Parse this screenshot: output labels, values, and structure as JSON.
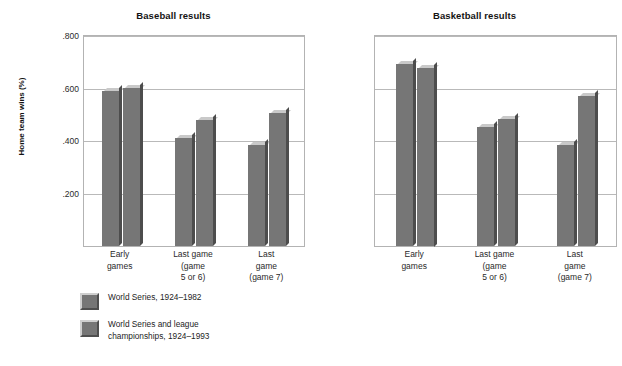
{
  "figure": {
    "ylabel": "Home team wins (%)"
  },
  "chart_data": [
    {
      "type": "bar",
      "title": "Baseball results",
      "xlabel": "",
      "ylabel": "Home team wins (%)",
      "ylim": [
        0,
        0.8
      ],
      "yticks": [
        ".200",
        ".400",
        ".600",
        ".800"
      ],
      "ytick_values": [
        0.2,
        0.4,
        0.6,
        0.8
      ],
      "grid": true,
      "legend_position": "below",
      "categories": [
        "Early games",
        "Last game (game 5 or 6)",
        "Last game (game 7)"
      ],
      "category_lines": [
        [
          "Early",
          "games"
        ],
        [
          "Last game",
          "(game",
          "5 or 6)"
        ],
        [
          "Last",
          "game",
          "(game 7)"
        ]
      ],
      "series": [
        {
          "name": "World Series, 1924–1982",
          "values": [
            0.59,
            0.41,
            0.383
          ]
        },
        {
          "name": "World Series and league championships, 1924–1993",
          "values": [
            0.602,
            0.48,
            0.505
          ]
        }
      ],
      "legend": [
        {
          "label_lines": [
            "World Series, 1924–1982"
          ]
        },
        {
          "label_lines": [
            "World Series and league",
            "championships, 1924–1993"
          ]
        }
      ]
    },
    {
      "type": "bar",
      "title": "Basketball results",
      "xlabel": "",
      "ylabel": "",
      "ylim": [
        0,
        0.8
      ],
      "yticks": [],
      "ytick_values": [
        0.2,
        0.4,
        0.6,
        0.8
      ],
      "grid": true,
      "legend_position": "below",
      "categories": [
        "Early games",
        "Last game (game 5 or 6)",
        "Last game (game 7)"
      ],
      "category_lines": [
        [
          "Early",
          "games"
        ],
        [
          "Last game",
          "(game",
          "5 or 6)"
        ],
        [
          "Last",
          "game",
          "(game 7)"
        ]
      ],
      "series": [
        {
          "name": "NBA semifinals and championships, 1967–1982",
          "values": [
            0.695,
            0.452,
            0.383
          ]
        },
        {
          "name": "NBA semifinals and championships, 1967–1993",
          "values": [
            0.68,
            0.485,
            0.572
          ]
        }
      ],
      "legend": [
        {
          "label_lines": [
            "NBA semifinals and championships,",
            "1967–1982"
          ]
        },
        {
          "label_lines": [
            "NBA semifinals and championships,",
            "1967–1993"
          ]
        }
      ]
    }
  ],
  "colors": {
    "bar_face": "#767676",
    "bar_top": "#c9c9c9",
    "bar_side": "#4d4d4d",
    "grid": "#b9b9b9",
    "axis": "#b3b3b3",
    "text": "#1a1a1a"
  }
}
